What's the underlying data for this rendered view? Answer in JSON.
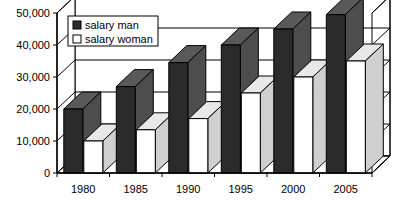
{
  "chart_data": {
    "type": "bar",
    "title": "",
    "subtitle": "",
    "xlabel": "",
    "ylabel": "",
    "categories": [
      "1980",
      "1985",
      "1990",
      "1995",
      "2000",
      "2005"
    ],
    "series": [
      {
        "name": "salary man",
        "color": "#2b2b2b",
        "values": [
          20000,
          27000,
          34500,
          40000,
          45000,
          49500
        ]
      },
      {
        "name": "salary woman",
        "color": "#ffffff",
        "values": [
          10000,
          13500,
          17000,
          25000,
          30000,
          35000
        ]
      }
    ],
    "ylim": [
      0,
      50000
    ],
    "ytick_values": [
      0,
      10000,
      20000,
      30000,
      40000,
      50000
    ],
    "ytick_labels": [
      "0",
      "10,000",
      "20,000",
      "30,000",
      "40,000",
      "50,000"
    ],
    "grid": true,
    "grid_axis": "y",
    "legend_position": "upper left inside",
    "three_d": true,
    "style": "black-and-white 3d column chart"
  },
  "legend": {
    "entries": [
      {
        "label": "salary man",
        "swatch": "dark"
      },
      {
        "label": "salary woman",
        "swatch": "white"
      }
    ]
  },
  "colors": {
    "series_man": "#2b2b2b",
    "series_man_side": "#4d4d4d",
    "series_man_top": "#595959",
    "series_woman": "#ffffff",
    "series_woman_side": "#cfcfcf",
    "series_woman_top": "#e8e8e8",
    "axis": "#000000",
    "grid": "#000000",
    "background": "#ffffff",
    "floor": "#ffffff",
    "wall": "#ffffff"
  }
}
